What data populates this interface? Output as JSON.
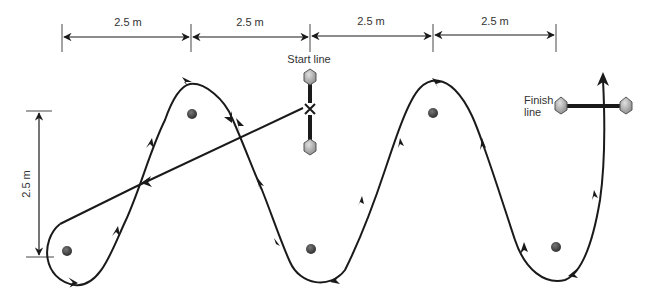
{
  "diagram": {
    "type": "slalom-course",
    "colors": {
      "line": "#1a1a1a",
      "cone": "#4a4a4a",
      "post_fill": "#b0b0b0",
      "text": "#333333"
    },
    "horizontal_dimensions": [
      {
        "label": "2.5 m"
      },
      {
        "label": "2.5 m"
      },
      {
        "label": "2.5 m"
      },
      {
        "label": "2.5 m"
      }
    ],
    "vertical_dimension": {
      "label": "2.5 m"
    },
    "start": {
      "label": "Start line",
      "marker": "X"
    },
    "finish": {
      "label_line1": "Finish",
      "label_line2": "line"
    },
    "cones": [
      {
        "name": "cone-1",
        "x": 67,
        "y": 250
      },
      {
        "name": "cone-2",
        "x": 192,
        "y": 114
      },
      {
        "name": "cone-3",
        "x": 311,
        "y": 249
      },
      {
        "name": "cone-4",
        "x": 433,
        "y": 113
      },
      {
        "name": "cone-5",
        "x": 556,
        "y": 247
      }
    ]
  }
}
